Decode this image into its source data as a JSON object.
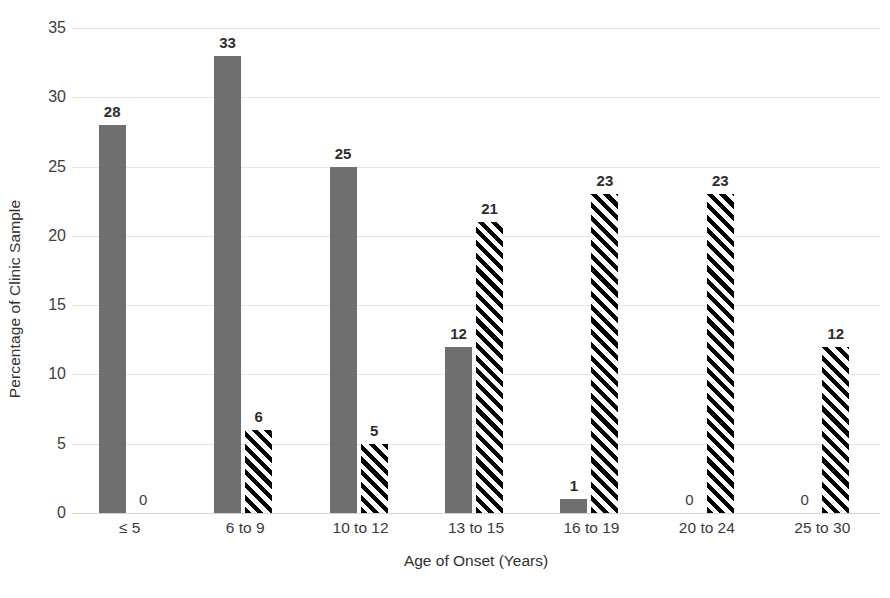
{
  "chart_data": {
    "type": "bar",
    "title": "",
    "subtitle": "",
    "xlabel": "Age of Onset (Years)",
    "ylabel": "Percentage of Clinic Sample",
    "categories": [
      "≤ 5",
      "6 to 9",
      "10 to 12",
      "13 to 15",
      "16 to 19",
      "20 to 24",
      "25 to 30"
    ],
    "series": [
      {
        "name": "solid-series",
        "style": "solid-gray",
        "color": "#6f6f6f",
        "values": [
          28,
          33,
          25,
          12,
          1,
          0,
          0
        ],
        "labels": [
          "28",
          "33",
          "25",
          "12",
          "1",
          "0",
          "0"
        ]
      },
      {
        "name": "hatched-series",
        "style": "black-diagonal-hatch",
        "color": "#000000",
        "values": [
          0,
          6,
          5,
          21,
          23,
          23,
          12
        ],
        "labels": [
          "0",
          "6",
          "5",
          "21",
          "23",
          "23",
          "12"
        ]
      }
    ],
    "ylim": [
      0,
      35
    ],
    "yticks": [
      0,
      5,
      10,
      15,
      20,
      25,
      30,
      35
    ],
    "ytick_labels": [
      "0",
      "5",
      "10",
      "15",
      "20",
      "25",
      "30",
      "35"
    ],
    "grid": true,
    "grid_axis": "y",
    "legend": "none",
    "legend_position": "none",
    "data_labels": true,
    "background": "#ffffff"
  }
}
